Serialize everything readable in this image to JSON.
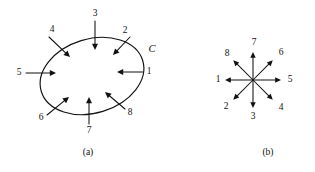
{
  "figure": {
    "width": 315,
    "height": 172,
    "background": "#ffffff",
    "ink": "#111111"
  },
  "panel_a": {
    "caption": "(a)",
    "caption_pos": {
      "x": 88,
      "y": 153
    },
    "curve_label": "C",
    "curve_label_pos": {
      "x": 152,
      "y": 50
    },
    "ellipse": {
      "cx": 92,
      "cy": 76,
      "rx": 53,
      "ry": 37,
      "rotation_deg": -17
    },
    "arrows": [
      {
        "label": "1",
        "label_pos": {
          "x": 149,
          "y": 72
        },
        "x1": 143,
        "y1": 72,
        "x2": 117,
        "y2": 72,
        "note": "points left (inward) from right side"
      },
      {
        "label": "2",
        "label_pos": {
          "x": 125,
          "y": 31
        },
        "x1": 130,
        "y1": 37,
        "x2": 113,
        "y2": 55,
        "note": "points down-left (inward) from upper right"
      },
      {
        "label": "3",
        "label_pos": {
          "x": 95,
          "y": 14
        },
        "x1": 95,
        "y1": 21,
        "x2": 95,
        "y2": 50,
        "note": "points down (inward) from top"
      },
      {
        "label": "4",
        "label_pos": {
          "x": 52,
          "y": 30
        },
        "x1": 49,
        "y1": 37,
        "x2": 70,
        "y2": 57,
        "note": "points down-right (inward) from upper left"
      },
      {
        "label": "5",
        "label_pos": {
          "x": 19,
          "y": 73
        },
        "x1": 26,
        "y1": 73,
        "x2": 56,
        "y2": 73,
        "note": "points right (inward) from left side"
      },
      {
        "label": "6",
        "label_pos": {
          "x": 41,
          "y": 118
        },
        "x1": 47,
        "y1": 115,
        "x2": 69,
        "y2": 97,
        "note": "points up-right (inward) from lower left"
      },
      {
        "label": "7",
        "label_pos": {
          "x": 89,
          "y": 131
        },
        "x1": 89,
        "y1": 124,
        "x2": 89,
        "y2": 97,
        "note": "points up (inward) from bottom"
      },
      {
        "label": "8",
        "label_pos": {
          "x": 130,
          "y": 113
        },
        "x1": 125,
        "y1": 109,
        "x2": 105,
        "y2": 92,
        "note": "points up-left (inward) from lower right"
      }
    ]
  },
  "panel_b": {
    "caption": "(b)",
    "caption_pos": {
      "x": 268,
      "y": 153
    },
    "center": {
      "x": 253,
      "y": 80
    },
    "ray_length": 28,
    "arrows": [
      {
        "label": "1",
        "direction": "west",
        "angle_deg": 180,
        "label_pos": {
          "x": 218,
          "y": 80
        }
      },
      {
        "label": "2",
        "direction": "southwest",
        "angle_deg": 225,
        "label_pos": {
          "x": 226,
          "y": 107
        }
      },
      {
        "label": "3",
        "direction": "south",
        "angle_deg": 270,
        "label_pos": {
          "x": 253,
          "y": 117
        }
      },
      {
        "label": "4",
        "direction": "southeast",
        "angle_deg": 315,
        "label_pos": {
          "x": 281,
          "y": 108
        }
      },
      {
        "label": "5",
        "direction": "east",
        "angle_deg": 0,
        "label_pos": {
          "x": 290,
          "y": 80
        }
      },
      {
        "label": "6",
        "direction": "northeast",
        "angle_deg": 45,
        "label_pos": {
          "x": 281,
          "y": 53
        }
      },
      {
        "label": "7",
        "direction": "north",
        "angle_deg": 90,
        "label_pos": {
          "x": 254,
          "y": 43
        }
      },
      {
        "label": "8",
        "direction": "northwest",
        "angle_deg": 135,
        "label_pos": {
          "x": 227,
          "y": 54
        }
      }
    ]
  }
}
